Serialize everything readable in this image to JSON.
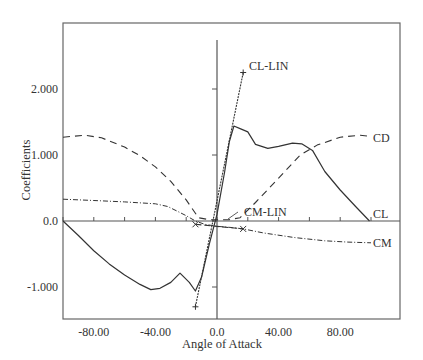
{
  "chart_data": {
    "type": "line",
    "title": "",
    "xlabel": "Angle of Attack",
    "ylabel": "Coefficients",
    "xlim": [
      -100,
      118
    ],
    "ylim": [
      -1.5,
      3.0
    ],
    "grid": false,
    "x_ticks": [
      -80,
      -40,
      0,
      40,
      80
    ],
    "x_tick_labels": [
      "-80.00",
      "-40.00",
      "0.0",
      "40.00",
      "80.00"
    ],
    "x_minor_ticks": [
      -100,
      -80,
      -60,
      -40,
      -20,
      0,
      20,
      40,
      60,
      80,
      100
    ],
    "y_ticks": [
      -1,
      0,
      1,
      2
    ],
    "y_tick_labels": [
      "-1.000",
      "0.0",
      "1.000",
      "2.000"
    ],
    "legend_position": "inline labels at line ends",
    "series": [
      {
        "name": "CL",
        "style": "solid",
        "label_at": [
          100,
          0.0
        ],
        "x": [
          -100,
          -90,
          -80,
          -70,
          -60,
          -50,
          -43,
          -37,
          -30,
          -24,
          -18,
          -14,
          -10,
          -5,
          0,
          5,
          8,
          11,
          15,
          20,
          25,
          33,
          40,
          49,
          55,
          62,
          70,
          80,
          90,
          99
        ],
        "y": [
          0.0,
          -0.22,
          -0.45,
          -0.65,
          -0.82,
          -0.96,
          -1.04,
          -1.02,
          -0.93,
          -0.79,
          -0.93,
          -1.06,
          -0.85,
          -0.35,
          0.1,
          0.75,
          1.2,
          1.44,
          1.4,
          1.35,
          1.16,
          1.1,
          1.13,
          1.18,
          1.17,
          1.07,
          0.75,
          0.47,
          0.22,
          0.0
        ]
      },
      {
        "name": "CD",
        "style": "long-dash",
        "label_at": [
          100,
          1.28
        ],
        "x": [
          -100,
          -86,
          -75,
          -60,
          -50,
          -40,
          -30,
          -20,
          -12,
          -5,
          0,
          8,
          15,
          25,
          40,
          54,
          65,
          80,
          93,
          100
        ],
        "y": [
          1.27,
          1.3,
          1.26,
          1.12,
          0.99,
          0.82,
          0.6,
          0.32,
          0.05,
          0.02,
          0.02,
          0.02,
          0.05,
          0.28,
          0.65,
          1.0,
          1.15,
          1.27,
          1.3,
          1.28
        ]
      },
      {
        "name": "CM",
        "style": "dash-dot",
        "label_at": [
          100,
          -0.33
        ],
        "x": [
          -100,
          -80,
          -60,
          -40,
          -32,
          -25,
          -20,
          -14,
          -8,
          0,
          10,
          17,
          30,
          50,
          70,
          85,
          100
        ],
        "y": [
          0.33,
          0.31,
          0.29,
          0.26,
          0.22,
          0.14,
          0.08,
          0.0,
          -0.05,
          -0.08,
          -0.1,
          -0.12,
          -0.18,
          -0.25,
          -0.3,
          -0.32,
          -0.33
        ]
      },
      {
        "name": "CL-LIN",
        "style": "dotted-solid with + markers",
        "label_at": [
          5,
          2.3
        ],
        "x": [
          -14,
          17
        ],
        "y": [
          -1.3,
          2.25
        ]
      },
      {
        "name": "CM-LIN",
        "style": "dashed with x markers",
        "label_at": [
          14,
          -0.05
        ],
        "x": [
          -14,
          17
        ],
        "y": [
          -0.05,
          -0.12
        ]
      }
    ]
  },
  "labels": {
    "xlabel": "Angle of Attack",
    "ylabel": "Coefficients",
    "cl": "CL",
    "cd": "CD",
    "cm": "CM",
    "cl_lin": "CL-LIN",
    "cm_lin": "CM-LIN"
  },
  "colors": {
    "axis": "#555555",
    "line": "#333333"
  }
}
